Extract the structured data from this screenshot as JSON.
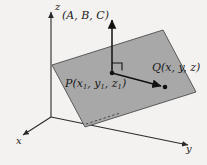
{
  "figure": {
    "background_color": "#f3f2f0",
    "plane_fill_color": "#a3a3a3",
    "plane_stroke_color": "#4d4d4d",
    "axis_color": "#2b2b2b",
    "vector_color": "#111111"
  },
  "axes": [
    {
      "name": "z-axis",
      "label": "z",
      "direction": "up"
    },
    {
      "name": "x-axis",
      "label": "x",
      "direction": "down-left"
    },
    {
      "name": "y-axis",
      "label": "y",
      "direction": "down-right"
    }
  ],
  "labels": {
    "z_axis": "z",
    "x_axis": "x",
    "y_axis": "y",
    "normal_vector": "(A, B, C)",
    "point_p": "P(x",
    "point_p_sub1": "1",
    "point_p_mid1": ", y",
    "point_p_sub2": "1",
    "point_p_mid2": ", z",
    "point_p_sub3": "1",
    "point_p_end": ")",
    "point_q": "Q(x, y, z)"
  },
  "points": [
    {
      "name": "point-p",
      "label": "P(x1, y1, z1)",
      "x": 112,
      "y": 73
    },
    {
      "name": "point-q",
      "label": "Q(x, y, z)",
      "x": 165,
      "y": 87
    }
  ],
  "vectors": [
    {
      "name": "normal-vector",
      "label": "(A, B, C)",
      "from": [
        112,
        73
      ],
      "to": [
        112,
        17
      ]
    },
    {
      "name": "pq-vector",
      "label": "PQ",
      "from": [
        112,
        73
      ],
      "to": [
        165,
        87
      ]
    }
  ],
  "annotations": [
    {
      "name": "right-angle-marker",
      "label": "90 degrees",
      "at": [
        112,
        73
      ]
    },
    {
      "name": "hidden-edge-dashes",
      "label": "hidden edge of plane"
    }
  ],
  "plane": {
    "name": "plane",
    "corners": [
      [
        52,
        65
      ],
      [
        163,
        30
      ],
      [
        196,
        92
      ],
      [
        85,
        127
      ]
    ]
  }
}
